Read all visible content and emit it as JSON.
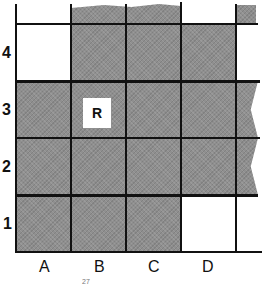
{
  "grid": {
    "rows": [
      "4",
      "3",
      "2",
      "1"
    ],
    "columns": [
      "A",
      "B",
      "C",
      "D"
    ],
    "shaded_cells": [
      "B4",
      "C4",
      "D4",
      "A3",
      "B3",
      "C3",
      "D3",
      "A2",
      "B2",
      "C2",
      "D2",
      "A1",
      "B1",
      "C1"
    ],
    "unshaded_cells": [
      "A4",
      "D1"
    ],
    "marker": {
      "cell": "B3",
      "label": "R"
    }
  },
  "footer_text": "27",
  "colors": {
    "shade": "#8f8f8f",
    "line": "#111111",
    "background": "#ffffff"
  }
}
